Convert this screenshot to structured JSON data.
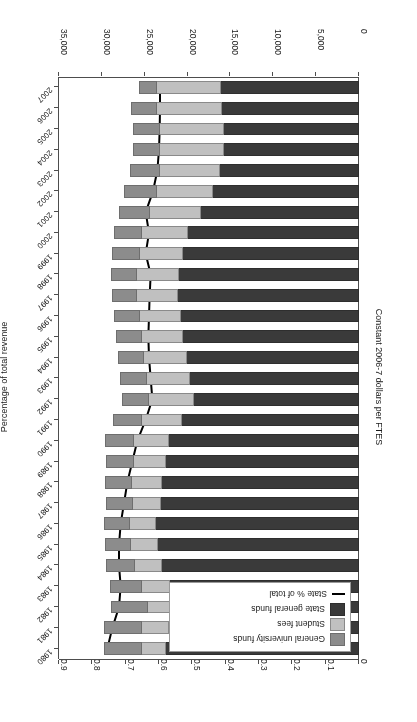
{
  "chart_data": {
    "type": "bar",
    "title": "",
    "subtitle": "",
    "orientation": "vertical-stacked-with-line-overlay",
    "xlabel": "",
    "ylabel": "Constant 2006-7 dollars per FTES",
    "y2label": "Percentage of total revenue",
    "ylim": [
      0,
      35000
    ],
    "y2lim": [
      0,
      0.9
    ],
    "ytick_labels": [
      "0",
      "5,000",
      "10,000",
      "15,000",
      "20,000",
      "25,000",
      "30,000",
      "35,000"
    ],
    "ytick_values": [
      0,
      5000,
      10000,
      15000,
      20000,
      25000,
      30000,
      35000
    ],
    "y2tick_labels": [
      "0",
      "0.1",
      "0.2",
      "0.3",
      "0.4",
      "0.5",
      "0.6",
      "0.7",
      "0.8",
      "0.9"
    ],
    "y2tick_values": [
      0,
      0.1,
      0.2,
      0.3,
      0.4,
      0.5,
      0.6,
      0.7,
      0.8,
      0.9
    ],
    "grid": false,
    "legend_position": "upper-left-inside",
    "categories": [
      "1980",
      "1981",
      "1982",
      "1983",
      "1984",
      "1985",
      "1986",
      "1987",
      "1988",
      "1989",
      "1990",
      "1991",
      "1992",
      "1993",
      "1994",
      "1995",
      "1996",
      "1997",
      "1998",
      "1999",
      "2000",
      "2001",
      "2002",
      "2003",
      "2004",
      "2005",
      "2006",
      "2007"
    ],
    "series": [
      {
        "name": "State general funds",
        "color": "#3a3a3a",
        "values": [
          22600,
          22300,
          21600,
          22200,
          23100,
          23600,
          23800,
          23200,
          23100,
          22600,
          22300,
          20800,
          19400,
          19800,
          20200,
          20600,
          20900,
          21200,
          21100,
          20600,
          20100,
          18600,
          17100,
          16300,
          15900,
          15900,
          16100,
          16200
        ]
      },
      {
        "name": "Student fees",
        "color": "#c0c0c0",
        "values": [
          3000,
          3200,
          3300,
          3400,
          3300,
          3200,
          3200,
          3400,
          3600,
          3900,
          4200,
          4800,
          5300,
          5200,
          5100,
          5000,
          4900,
          4900,
          5000,
          5200,
          5400,
          6000,
          6700,
          7200,
          7500,
          7600,
          7700,
          7600
        ]
      },
      {
        "name": "General university funds",
        "color": "#8c8c8c",
        "values": [
          4400,
          4500,
          4300,
          3700,
          3300,
          3100,
          3000,
          3100,
          3200,
          3300,
          3400,
          3300,
          3200,
          3100,
          3000,
          3000,
          3000,
          3000,
          3100,
          3200,
          3300,
          3600,
          3900,
          3400,
          3200,
          3100,
          3000,
          2100
        ]
      },
      {
        "name": "State % of total",
        "type": "line",
        "color": "#000000",
        "axis": "secondary",
        "values": [
          0.755,
          0.74,
          0.72,
          0.715,
          0.72,
          0.72,
          0.715,
          0.705,
          0.695,
          0.68,
          0.665,
          0.64,
          0.62,
          0.625,
          0.63,
          0.632,
          0.63,
          0.628,
          0.625,
          0.64,
          0.63,
          0.64,
          0.618,
          0.605,
          0.6,
          0.598,
          0.597,
          0.597
        ]
      }
    ],
    "legend": [
      {
        "label": "General university funds",
        "key": "swatch",
        "color": "#8c8c8c"
      },
      {
        "label": "Student fees",
        "key": "swatch",
        "color": "#c0c0c0"
      },
      {
        "label": "State general funds",
        "key": "swatch",
        "color": "#3a3a3a"
      },
      {
        "label": "State % of total",
        "key": "line",
        "color": "#000000"
      }
    ]
  },
  "axes": {
    "primary_title": "Constant 2006-7 dollars per FTES",
    "secondary_title": "Percentage of total revenue"
  }
}
